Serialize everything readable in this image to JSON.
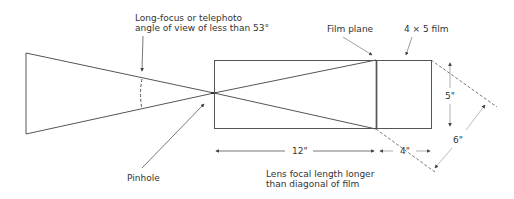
{
  "diagram": {
    "type": "camera-optics-illustration",
    "colors": {
      "line": "#555555",
      "film_plane": "#333333",
      "dashed": "#555555",
      "dimension": "#999999",
      "text": "#333333"
    }
  },
  "labels": {
    "angle_note_line1": "Long-focus or telephoto",
    "angle_note_line2": "angle of view of less than 53°",
    "film_plane": "Film plane",
    "film_size": "4 × 5 film",
    "pinhole": "Pinhole",
    "focal_note_line1": "Lens focal length longer",
    "focal_note_line2": "than diagonal of film",
    "dim_focal_length": "12\"",
    "dim_film_width": "4\"",
    "dim_film_height": "5\"",
    "dim_film_diagonal": "6\""
  }
}
